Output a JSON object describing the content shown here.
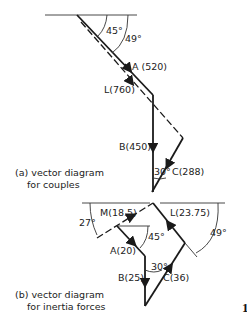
{
  "diagram_a": {
    "caption_line1": "(a) vector diagram",
    "caption_line2": "for couples",
    "angle_a": "45°",
    "angle_l": "49°",
    "angle_c": "30°",
    "label_a": "A (520)",
    "label_l": "L(760)",
    "label_b": "B(450)",
    "label_c": "C(288)"
  },
  "diagram_b": {
    "caption_line1": "(b) vector diagram",
    "caption_line2": "for inertia forces",
    "angle_m": "27°",
    "angle_a": "45°",
    "angle_l": "49°",
    "angle_c": "30°",
    "label_m": "M(18.5)",
    "label_a": "A(20)",
    "label_b": "B(25)",
    "label_c": "C(36)",
    "label_l": "L(23.75)"
  },
  "figure_marker": "1"
}
